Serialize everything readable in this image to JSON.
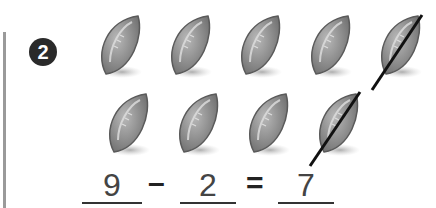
{
  "problem": {
    "number": "2",
    "equation": {
      "minuend": "9",
      "minus": "–",
      "subtrahend": "2",
      "equals": "=",
      "difference": "7"
    },
    "balls": {
      "total": 9,
      "crossed_out": 2,
      "row1": [
        false,
        false,
        false,
        false,
        true
      ],
      "row2": [
        false,
        false,
        false,
        true
      ]
    },
    "colors": {
      "ball": "#8a8a8a",
      "line": "#111111",
      "badge": "#2a2a2a"
    }
  }
}
